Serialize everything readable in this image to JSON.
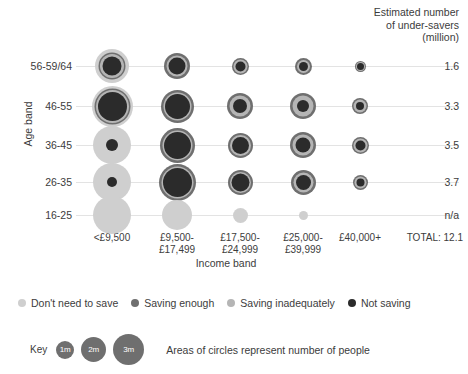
{
  "header": {
    "line1": "Estimated number",
    "line2": "of under-savers",
    "line3": "(million)"
  },
  "axes": {
    "y_title": "Age band",
    "x_title": "Income band",
    "total_label": "TOTAL: 12.1"
  },
  "legend": {
    "categories": [
      {
        "label": "Don't need to save",
        "color": "#cfcfcf"
      },
      {
        "label": "Saving enough",
        "color": "#6f6f6f"
      },
      {
        "label": "Saving inadequately",
        "color": "#b5b5b5"
      },
      {
        "label": "Not saving",
        "color": "#2b2b2b"
      }
    ]
  },
  "key": {
    "word": "Key",
    "bubbles": [
      {
        "label": "1m",
        "d": 18
      },
      {
        "label": "2m",
        "d": 25
      },
      {
        "label": "3m",
        "d": 31
      }
    ],
    "note": "Areas of circles represent number of people"
  },
  "chart_data": {
    "type": "bubble",
    "title": "Estimated number of under-savers (million)",
    "xlabel": "Income band",
    "ylabel": "Age band",
    "grid": true,
    "legend_position": "bottom",
    "categories_x": [
      "<£9,500",
      "£9,500-£17,499",
      "£17,500-£24,999",
      "£25,000-£39,999",
      "£40,000+"
    ],
    "categories_x_lines": [
      [
        "<£9,500"
      ],
      [
        "£9,500-",
        "£17,499"
      ],
      [
        "£17,500-",
        "£24,999"
      ],
      [
        "£25,000-",
        "£39,999"
      ],
      [
        "£40,000+"
      ]
    ],
    "categories_y": [
      "56-59/64",
      "46-55",
      "36-45",
      "26-35",
      "16-25"
    ],
    "row_values": [
      "1.6",
      "3.3",
      "3.5",
      "3.7",
      "n/a"
    ],
    "total": "TOTAL: 12.1",
    "series_names": [
      "Don't need to save",
      "Saving enough",
      "Saving inadequately",
      "Not saving"
    ],
    "series_colors": [
      "#cfcfcf",
      "#6f6f6f",
      "#b5b5b5",
      "#2b2b2b"
    ],
    "note": "Concentric circles: outer ring = Don't need to save, then Saving enough, then Saving inadequately, core = Not saving. Diameters in px approximate circle areas.",
    "cells": [
      {
        "row": "56-59/64",
        "col": "<£9,500",
        "rings": [
          34,
          27,
          24,
          19
        ]
      },
      {
        "row": "56-59/64",
        "col": "£9,500-£17,499",
        "rings": [
          0,
          26,
          21,
          17
        ]
      },
      {
        "row": "56-59/64",
        "col": "£17,500-£24,999",
        "rings": [
          0,
          17,
          14,
          10
        ]
      },
      {
        "row": "56-59/64",
        "col": "£25,000-£39,999",
        "rings": [
          0,
          17,
          13,
          9
        ]
      },
      {
        "row": "56-59/64",
        "col": "£40,000+",
        "rings": [
          0,
          11,
          9,
          7
        ]
      },
      {
        "row": "46-55",
        "col": "<£9,500",
        "rings": [
          41,
          36,
          33,
          29
        ]
      },
      {
        "row": "46-55",
        "col": "£9,500-£17,499",
        "rings": [
          0,
          33,
          28,
          25
        ]
      },
      {
        "row": "46-55",
        "col": "£17,500-£24,999",
        "rings": [
          0,
          26,
          21,
          14
        ]
      },
      {
        "row": "46-55",
        "col": "£25,000-£39,999",
        "rings": [
          0,
          26,
          21,
          12
        ]
      },
      {
        "row": "46-55",
        "col": "£40,000+",
        "rings": [
          0,
          16,
          13,
          8
        ]
      },
      {
        "row": "36-45",
        "col": "<£9,500",
        "rings": [
          38,
          0,
          0,
          12
        ]
      },
      {
        "row": "36-45",
        "col": "£9,500-£17,499",
        "rings": [
          0,
          35,
          30,
          27
        ]
      },
      {
        "row": "36-45",
        "col": "£17,500-£24,999",
        "rings": [
          0,
          25,
          21,
          17
        ]
      },
      {
        "row": "36-45",
        "col": "£25,000-£39,999",
        "rings": [
          0,
          26,
          21,
          15
        ]
      },
      {
        "row": "36-45",
        "col": "£40,000+",
        "rings": [
          0,
          17,
          14,
          10
        ]
      },
      {
        "row": "26-35",
        "col": "<£9,500",
        "rings": [
          38,
          0,
          0,
          10
        ]
      },
      {
        "row": "26-35",
        "col": "£9,500-£17,499",
        "rings": [
          0,
          37,
          32,
          29
        ]
      },
      {
        "row": "26-35",
        "col": "£17,500-£24,999",
        "rings": [
          0,
          25,
          21,
          18
        ]
      },
      {
        "row": "26-35",
        "col": "£25,000-£39,999",
        "rings": [
          0,
          25,
          20,
          15
        ]
      },
      {
        "row": "26-35",
        "col": "£40,000+",
        "rings": [
          0,
          15,
          12,
          8
        ]
      },
      {
        "row": "16-25",
        "col": "<£9,500",
        "rings": [
          38,
          0,
          0,
          0
        ]
      },
      {
        "row": "16-25",
        "col": "£9,500-£17,499",
        "rings": [
          30,
          0,
          0,
          0
        ]
      },
      {
        "row": "16-25",
        "col": "£17,500-£24,999",
        "rings": [
          15,
          0,
          0,
          0
        ]
      },
      {
        "row": "16-25",
        "col": "£25,000-£39,999",
        "rings": [
          9,
          0,
          0,
          0
        ]
      },
      {
        "row": "16-25",
        "col": "£40,000+",
        "rings": [
          0,
          0,
          0,
          0
        ]
      }
    ],
    "layout": {
      "row_y": [
        66,
        106,
        145,
        182,
        215
      ],
      "col_x": [
        112,
        177,
        240,
        303,
        360
      ]
    }
  }
}
